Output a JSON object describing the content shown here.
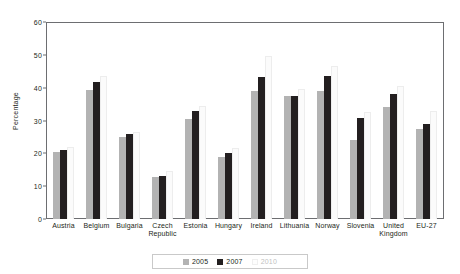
{
  "chart_data": {
    "type": "bar",
    "title": "",
    "xlabel": "",
    "ylabel": "Percentage",
    "ylim": [
      0,
      60
    ],
    "yticks": [
      0,
      10,
      20,
      30,
      40,
      50,
      60
    ],
    "grid": false,
    "legend_position": "bottom-center",
    "categories": [
      "Austria",
      "Belgium",
      "Bulgaria",
      "Czech\nRepublic",
      "Estonia",
      "Hungary",
      "Ireland",
      "Lithuania",
      "Norway",
      "Slovenia",
      "United\nKingdom",
      "EU-27"
    ],
    "series": [
      {
        "name": "2005",
        "color": "#b3b3b3",
        "values": [
          20.3,
          39.2,
          25.0,
          12.9,
          30.5,
          19.0,
          39.0,
          37.5,
          39.0,
          24.0,
          34.2,
          27.5
        ]
      },
      {
        "name": "2007",
        "color": "#231f20",
        "values": [
          21.0,
          41.8,
          25.8,
          13.1,
          33.0,
          20.0,
          43.3,
          37.6,
          43.5,
          30.8,
          38.0,
          29.0
        ]
      },
      {
        "name": "2010",
        "color": "#fbfbfb",
        "values": [
          22.0,
          43.5,
          26.5,
          14.5,
          34.5,
          21.5,
          49.8,
          39.5,
          46.5,
          32.5,
          40.5,
          32.8
        ]
      }
    ]
  },
  "axis": {
    "y_title": "Percentage",
    "y_tick_labels": [
      "0",
      "10",
      "20",
      "30",
      "40",
      "50",
      "60"
    ]
  },
  "legend": {
    "items": [
      {
        "label": "2005",
        "swatch": "legend-swatch-2005"
      },
      {
        "label": "2007",
        "swatch": "legend-swatch-2007"
      },
      {
        "label": "2010",
        "swatch": "legend-swatch-2010"
      }
    ]
  },
  "x_labels": [
    {
      "line1": "Austria",
      "line2": ""
    },
    {
      "line1": "Belgium",
      "line2": ""
    },
    {
      "line1": "Bulgaria",
      "line2": ""
    },
    {
      "line1": "Czech",
      "line2": "Republic"
    },
    {
      "line1": "Estonia",
      "line2": ""
    },
    {
      "line1": "Hungary",
      "line2": ""
    },
    {
      "line1": "Ireland",
      "line2": ""
    },
    {
      "line1": "Lithuania",
      "line2": ""
    },
    {
      "line1": "Norway",
      "line2": ""
    },
    {
      "line1": "Slovenia",
      "line2": ""
    },
    {
      "line1": "United",
      "line2": "Kingdom"
    },
    {
      "line1": "EU-27",
      "line2": ""
    }
  ]
}
